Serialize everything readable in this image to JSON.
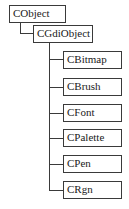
{
  "diagram": {
    "type": "class-hierarchy",
    "root": {
      "label": "CObject",
      "children": [
        {
          "label": "CGdiObject",
          "children": [
            {
              "label": "CBitmap"
            },
            {
              "label": "CBrush"
            },
            {
              "label": "CFont"
            },
            {
              "label": "CPalette"
            },
            {
              "label": "CPen"
            },
            {
              "label": "CRgn"
            }
          ]
        }
      ]
    },
    "nodes": {
      "cobject": "CObject",
      "cgdiobject": "CGdiObject",
      "cbitmap": "CBitmap",
      "cbrush": "CBrush",
      "cfont": "CFont",
      "cpalette": "CPalette",
      "cpen": "CPen",
      "crgn": "CRgn"
    },
    "colors": {
      "line": "#3a3a3a",
      "text": "#1a1a1a",
      "background": "#ffffff"
    }
  }
}
